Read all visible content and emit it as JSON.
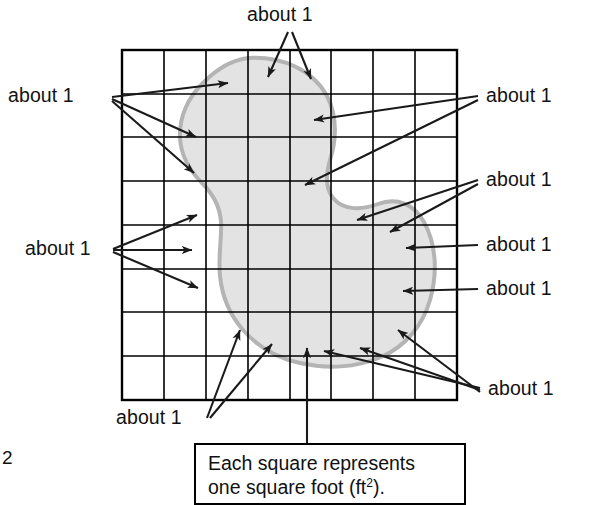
{
  "figure": {
    "title_semantic": "area-estimation-grid-figure",
    "page_number": "2",
    "grid": {
      "columns": 8,
      "rows": 8,
      "x": 122,
      "y": 50,
      "cell_w": 42,
      "cell_h": 43.75,
      "line_color": "#000000",
      "border_width": 2.2,
      "inner_width": 1.6
    },
    "shape": {
      "name": "irregular-blob-region",
      "fill_color": "#e3e3e3",
      "stroke_color": "#b4b4b4",
      "stroke_width": 4
    }
  },
  "labels": {
    "about": "about 1",
    "top": "about 1",
    "left_upper": "about 1",
    "left_lower": "about 1",
    "right_1": "about 1",
    "right_2": "about 1",
    "right_3": "about 1",
    "right_4": "about 1",
    "bottom_left": "about 1",
    "bottom_right": "about 1"
  },
  "caption": {
    "line1": "Each square represents",
    "line2_pre": "one square foot (ft",
    "line2_sup": "2",
    "line2_post": ")."
  }
}
